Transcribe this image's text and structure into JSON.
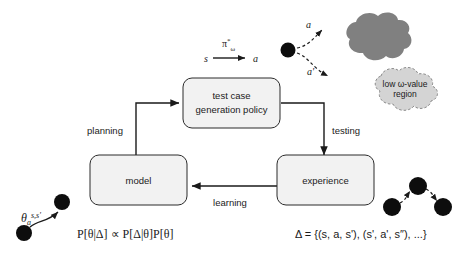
{
  "figure": {
    "background_color": "#ffffff"
  },
  "nodes": [
    {
      "id": "policy",
      "label_line1": "test case",
      "label_line2": "generation policy",
      "fill": "#f2f2f2",
      "stroke": "#2b2b2b"
    },
    {
      "id": "model",
      "label_line1": "model",
      "label_line2": "",
      "fill": "#f2f2f2",
      "stroke": "#2b2b2b"
    },
    {
      "id": "experience",
      "label_line1": "experience",
      "label_line2": "",
      "fill": "#f2f2f2",
      "stroke": "#2b2b2b"
    }
  ],
  "edges": [
    {
      "id": "planning",
      "label": "planning",
      "from": "model",
      "to": "policy"
    },
    {
      "id": "testing",
      "label": "testing",
      "from": "policy",
      "to": "experience"
    },
    {
      "id": "learning",
      "label": "learning",
      "from": "experience",
      "to": "model"
    }
  ],
  "policy_annotation": {
    "policy_symbol": "π",
    "policy_superscript": "*",
    "policy_subscript": "ω",
    "state_symbol": "s",
    "action_symbol": "a"
  },
  "clouds": [
    {
      "id": "dark-region",
      "label": "",
      "fill": "#808080",
      "style": "solid"
    },
    {
      "id": "low-omega-region",
      "label_line1": "low ω-value",
      "label_line2": "region",
      "fill": "#d4d4d4",
      "style": "dashed"
    }
  ],
  "action_arrows": [
    {
      "id": "action-a",
      "label": "a",
      "target": "dark-region"
    },
    {
      "id": "action-a-prime",
      "label": "a'",
      "target": "low-omega-region"
    }
  ],
  "formulas": {
    "theta_label": "θ",
    "theta_subscript": "a",
    "theta_superscript": "s,s'",
    "bayes": "P[θ|Δ] ∝ P[Δ|θ]P[θ]",
    "dataset": "Δ = {(s, a, s'), (s', a', s″), ...}"
  },
  "colors": {
    "line": "#1a1a1a",
    "dot": "#0d0d0d",
    "box_fill": "#f2f2f2",
    "cloud_dark": "#808080",
    "cloud_light": "#d4d4d4"
  }
}
